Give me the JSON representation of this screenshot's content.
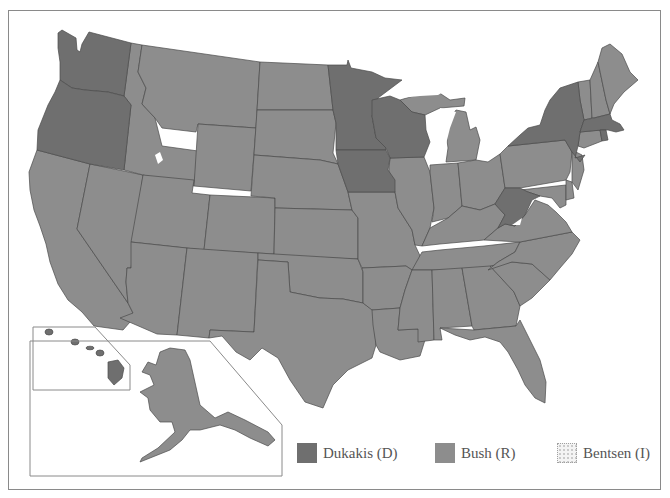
{
  "map": {
    "title": "1988 United States presidential election results by state",
    "colors": {
      "dukakis": "#6f6f6f",
      "bush": "#8d8d8d",
      "bentsen_fill": "#f4f4f4",
      "bentsen_dots": "#9a9a9a",
      "border": "#4a4a4a",
      "frame": "#8a8a8a",
      "water": "#ffffff"
    },
    "states_dukakis": [
      "WA",
      "OR",
      "MN",
      "WI",
      "IA",
      "NY",
      "MA",
      "RI",
      "WV",
      "HI",
      "DC"
    ],
    "states_bush": [
      "CA",
      "NV",
      "ID",
      "MT",
      "WY",
      "UT",
      "AZ",
      "CO",
      "NM",
      "ND",
      "SD",
      "NE",
      "KS",
      "OK",
      "TX",
      "MO",
      "AR",
      "LA",
      "IL",
      "MI",
      "IN",
      "OH",
      "KY",
      "TN",
      "MS",
      "AL",
      "GA",
      "FL",
      "SC",
      "NC",
      "VA",
      "MD",
      "DE",
      "NJ",
      "PA",
      "CT",
      "VT",
      "NH",
      "ME",
      "AK"
    ],
    "states_bentsen": [],
    "insets": [
      "Alaska",
      "Hawaii"
    ]
  },
  "legend": {
    "items": [
      {
        "label": "Dukakis (D)",
        "color": "#6f6f6f",
        "pattern": "solid"
      },
      {
        "label": "Bush (R)",
        "color": "#8d8d8d",
        "pattern": "solid"
      },
      {
        "label": "Bentsen (I)",
        "color": "#f4f4f4",
        "pattern": "dotted"
      }
    ]
  }
}
